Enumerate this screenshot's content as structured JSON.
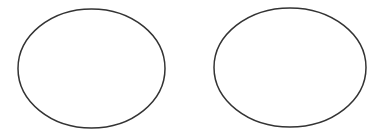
{
  "canvas": {
    "width": 385,
    "height": 135,
    "background": "#ffffff"
  },
  "shapes": [
    {
      "type": "ellipse",
      "name": "left-ellipse",
      "cx": 91.5,
      "cy": 68.5,
      "rx": 73.5,
      "ry": 59.5,
      "stroke": "#333333",
      "stroke_width": 1.5,
      "fill": "none"
    },
    {
      "type": "ellipse",
      "name": "right-ellipse",
      "cx": 290,
      "cy": 67.5,
      "rx": 76,
      "ry": 59.5,
      "stroke": "#333333",
      "stroke_width": 1.5,
      "fill": "none"
    }
  ]
}
